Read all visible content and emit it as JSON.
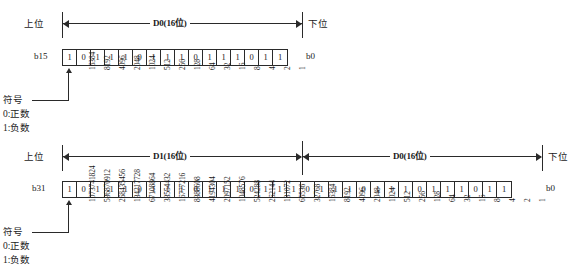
{
  "figure": {
    "labels": {
      "upper_side": "上位",
      "lower_side": "下位",
      "sign": "符号",
      "sign_positive": "0:正数",
      "sign_negative": "1:负数"
    }
  },
  "diagram16": {
    "span_title": "D0(16位)",
    "msb_label": "b15",
    "lsb_label": "b0",
    "bits": [
      "1",
      "0",
      "1",
      "1",
      "1",
      "0",
      "1",
      "1",
      "1",
      "0",
      "1",
      "1",
      "1",
      "0",
      "1",
      "1"
    ],
    "weights": [
      "",
      "16384",
      "8192",
      "4096",
      "2048",
      "1024",
      "512",
      "256",
      "128",
      "64",
      "32",
      "16",
      "8",
      "4",
      "2",
      "1"
    ]
  },
  "diagram32": {
    "span_title_high": "D1(16位)",
    "span_title_low": "D0(16位)",
    "msb_label": "b31",
    "lsb_label": "b0",
    "bits": [
      "1",
      "0",
      "1",
      "1",
      "1",
      "0",
      "1",
      "1",
      "1",
      "0",
      "1",
      "1",
      "1",
      "0",
      "1",
      "1",
      "1",
      "0",
      "1",
      "1",
      "1",
      "0",
      "1",
      "1",
      "1",
      "0",
      "1",
      "1",
      "1",
      "0",
      "1",
      "1"
    ],
    "weights": [
      "",
      "1073741824",
      "536870912",
      "268435456",
      "134217728",
      "67108864",
      "33554432",
      "16777216",
      "8388608",
      "4194304",
      "2097152",
      "1048576",
      "524288",
      "262144",
      "131072",
      "65536",
      "32768",
      "16384",
      "8192",
      "4096",
      "2048",
      "1024",
      "512",
      "256",
      "128",
      "64",
      "32",
      "16",
      "8",
      "4",
      "2",
      "1"
    ]
  }
}
